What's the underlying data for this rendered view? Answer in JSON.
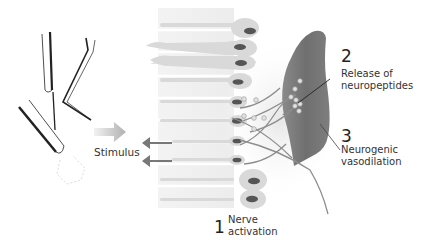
{
  "diagram": {
    "colors": {
      "background": "#ffffff",
      "skin_band": "#efefef",
      "cell": "#d8d8d8",
      "nucleus": "#555555",
      "vessel": "#777777",
      "fiber": "#909090",
      "arrow": "#7a7a7a",
      "stimulus_arrow": "#b5b5b5",
      "instrument": "#222222",
      "text": "#333333"
    },
    "instruments": [
      "tuning-fork",
      "bent-probe",
      "brush-probe"
    ],
    "labels": {
      "stimulus": "Stimulus",
      "step1": {
        "number": "1",
        "line1": "Nerve",
        "line2": "activation"
      },
      "step2": {
        "number": "2",
        "line1": "Release of",
        "line2": "neuropeptides"
      },
      "step3": {
        "number": "3",
        "line1": "Neurogenic",
        "line2": "vasodilation"
      }
    }
  }
}
